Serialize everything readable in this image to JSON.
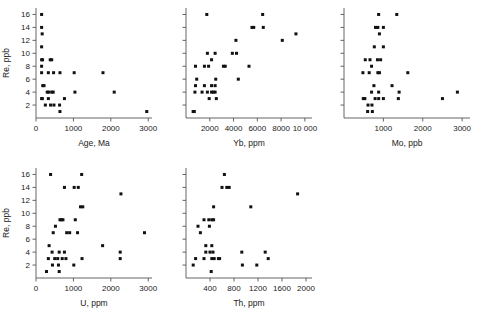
{
  "figure": {
    "background": "#ffffff",
    "marker_color": "#111111",
    "axis_color": "#555555"
  },
  "chart_data": [
    {
      "id": "panel-age",
      "type": "scatter",
      "title": "",
      "xlabel": "Age, Ma",
      "ylabel": "Re, ppb",
      "xlim": [
        0,
        3100
      ],
      "ylim": [
        0,
        17
      ],
      "xticks": [
        0,
        1000,
        2000,
        3000
      ],
      "xtick_labels": [
        "0",
        "1000",
        "2000",
        "3000"
      ],
      "yticks": [
        2,
        4,
        6,
        8,
        10,
        12,
        14,
        16
      ],
      "ytick_labels": [
        "2",
        "4",
        "6",
        "8",
        "10",
        "12",
        "14",
        "16"
      ],
      "grid": false,
      "legend": "none",
      "points": [
        [
          150,
          16
        ],
        [
          150,
          14
        ],
        [
          165,
          13
        ],
        [
          150,
          11
        ],
        [
          150,
          9
        ],
        [
          175,
          9
        ],
        [
          380,
          9
        ],
        [
          420,
          9
        ],
        [
          150,
          8
        ],
        [
          150,
          7
        ],
        [
          330,
          7
        ],
        [
          470,
          7
        ],
        [
          640,
          7
        ],
        [
          1020,
          7
        ],
        [
          1790,
          7
        ],
        [
          180,
          5
        ],
        [
          215,
          5
        ],
        [
          300,
          4
        ],
        [
          340,
          4
        ],
        [
          420,
          4
        ],
        [
          460,
          4
        ],
        [
          1040,
          4
        ],
        [
          2090,
          4
        ],
        [
          150,
          3
        ],
        [
          170,
          3
        ],
        [
          330,
          3
        ],
        [
          760,
          3
        ],
        [
          250,
          2
        ],
        [
          390,
          2
        ],
        [
          480,
          2
        ],
        [
          630,
          2
        ],
        [
          640,
          1
        ],
        [
          2960,
          1
        ]
      ]
    },
    {
      "id": "panel-yb",
      "type": "scatter",
      "title": "",
      "xlabel": "Yb, ppm",
      "ylabel": "",
      "xlim": [
        0,
        10600
      ],
      "ylim": [
        0,
        17
      ],
      "xticks": [
        2000,
        4000,
        6000,
        8000,
        10000
      ],
      "xtick_labels": [
        "2000",
        "4000",
        "6000",
        "8000",
        "10 000"
      ],
      "yticks": [
        2,
        4,
        6,
        8,
        10,
        12,
        14,
        16
      ],
      "ytick_labels": [],
      "grid": false,
      "legend": "none",
      "points": [
        [
          1750,
          16
        ],
        [
          6450,
          16
        ],
        [
          5550,
          14
        ],
        [
          5700,
          14
        ],
        [
          6500,
          14
        ],
        [
          9250,
          13
        ],
        [
          4200,
          12
        ],
        [
          8100,
          12
        ],
        [
          1800,
          10
        ],
        [
          2450,
          10
        ],
        [
          3900,
          10
        ],
        [
          4250,
          10
        ],
        [
          2150,
          9
        ],
        [
          800,
          8
        ],
        [
          1550,
          8
        ],
        [
          1900,
          8
        ],
        [
          3150,
          8
        ],
        [
          3300,
          8
        ],
        [
          5300,
          8
        ],
        [
          900,
          6
        ],
        [
          2500,
          6
        ],
        [
          4400,
          6
        ],
        [
          800,
          5
        ],
        [
          1550,
          5
        ],
        [
          2150,
          5
        ],
        [
          2450,
          5
        ],
        [
          750,
          4
        ],
        [
          1350,
          4
        ],
        [
          1800,
          4
        ],
        [
          2150,
          4
        ],
        [
          2300,
          4
        ],
        [
          2450,
          4
        ],
        [
          1950,
          3
        ],
        [
          2550,
          3
        ],
        [
          600,
          1
        ],
        [
          700,
          1
        ]
      ]
    },
    {
      "id": "panel-mo",
      "type": "scatter",
      "title": "",
      "xlabel": "Mo, ppb",
      "ylabel": "",
      "xlim": [
        0,
        3200
      ],
      "ylim": [
        0,
        17
      ],
      "xticks": [
        1000,
        2000,
        3000
      ],
      "xtick_labels": [
        "1000",
        "2000",
        "3000"
      ],
      "yticks": [
        2,
        4,
        6,
        8,
        10,
        12,
        14,
        16
      ],
      "ytick_labels": [],
      "grid": false,
      "legend": "none",
      "points": [
        [
          880,
          16
        ],
        [
          1340,
          16
        ],
        [
          800,
          14
        ],
        [
          860,
          14
        ],
        [
          1000,
          14
        ],
        [
          900,
          13
        ],
        [
          770,
          11
        ],
        [
          1000,
          11
        ],
        [
          540,
          9
        ],
        [
          660,
          9
        ],
        [
          850,
          9
        ],
        [
          930,
          9
        ],
        [
          700,
          8
        ],
        [
          480,
          7
        ],
        [
          640,
          7
        ],
        [
          860,
          7
        ],
        [
          900,
          7
        ],
        [
          1620,
          7
        ],
        [
          760,
          5
        ],
        [
          1220,
          5
        ],
        [
          700,
          4
        ],
        [
          880,
          4
        ],
        [
          1400,
          4
        ],
        [
          2880,
          4
        ],
        [
          490,
          3
        ],
        [
          530,
          3
        ],
        [
          790,
          3
        ],
        [
          880,
          3
        ],
        [
          1000,
          3
        ],
        [
          1380,
          3
        ],
        [
          2500,
          3
        ],
        [
          610,
          2
        ],
        [
          710,
          2
        ],
        [
          600,
          1
        ],
        [
          720,
          1
        ]
      ]
    },
    {
      "id": "panel-u",
      "type": "scatter",
      "title": "",
      "xlabel": "U, ppm",
      "ylabel": "Re, ppb",
      "xlim": [
        0,
        3100
      ],
      "ylim": [
        0,
        17
      ],
      "xticks": [
        0,
        1000,
        2000,
        3000
      ],
      "xtick_labels": [
        "0",
        "1000",
        "2000",
        "3000"
      ],
      "yticks": [
        2,
        4,
        6,
        8,
        10,
        12,
        14,
        16
      ],
      "ytick_labels": [
        "2",
        "4",
        "6",
        "8",
        "10",
        "12",
        "14",
        "16"
      ],
      "grid": false,
      "legend": "none",
      "points": [
        [
          390,
          16
        ],
        [
          1220,
          16
        ],
        [
          760,
          14
        ],
        [
          1020,
          14
        ],
        [
          1130,
          14
        ],
        [
          2270,
          13
        ],
        [
          1190,
          11
        ],
        [
          1250,
          11
        ],
        [
          640,
          9
        ],
        [
          680,
          9
        ],
        [
          720,
          9
        ],
        [
          1050,
          9
        ],
        [
          520,
          8
        ],
        [
          460,
          7
        ],
        [
          820,
          7
        ],
        [
          900,
          7
        ],
        [
          1110,
          7
        ],
        [
          2900,
          7
        ],
        [
          350,
          5
        ],
        [
          1780,
          5
        ],
        [
          430,
          4
        ],
        [
          620,
          4
        ],
        [
          760,
          4
        ],
        [
          2250,
          4
        ],
        [
          330,
          3
        ],
        [
          500,
          3
        ],
        [
          580,
          3
        ],
        [
          700,
          3
        ],
        [
          800,
          3
        ],
        [
          1230,
          3
        ],
        [
          2250,
          3
        ],
        [
          440,
          2
        ],
        [
          600,
          2
        ],
        [
          1010,
          2
        ],
        [
          280,
          1
        ],
        [
          620,
          1
        ]
      ]
    },
    {
      "id": "panel-th",
      "type": "scatter",
      "title": "",
      "xlabel": "Th, ppm",
      "ylabel": "",
      "xlim": [
        0,
        2100
      ],
      "ylim": [
        0,
        17
      ],
      "xticks": [
        400,
        800,
        1200,
        1600,
        2000
      ],
      "xtick_labels": [
        "400",
        "800",
        "1200",
        "1600",
        "2000"
      ],
      "yticks": [
        2,
        4,
        6,
        8,
        10,
        12,
        14,
        16
      ],
      "ytick_labels": [],
      "grid": false,
      "legend": "none",
      "points": [
        [
          640,
          16
        ],
        [
          600,
          14
        ],
        [
          680,
          14
        ],
        [
          720,
          14
        ],
        [
          1860,
          13
        ],
        [
          460,
          11
        ],
        [
          1080,
          11
        ],
        [
          300,
          9
        ],
        [
          380,
          9
        ],
        [
          430,
          9
        ],
        [
          460,
          9
        ],
        [
          200,
          8
        ],
        [
          390,
          8
        ],
        [
          240,
          7
        ],
        [
          330,
          5
        ],
        [
          430,
          5
        ],
        [
          330,
          4
        ],
        [
          400,
          4
        ],
        [
          450,
          4
        ],
        [
          930,
          4
        ],
        [
          1320,
          4
        ],
        [
          160,
          3
        ],
        [
          300,
          3
        ],
        [
          430,
          3
        ],
        [
          470,
          3
        ],
        [
          540,
          3
        ],
        [
          560,
          3
        ],
        [
          1370,
          3
        ],
        [
          940,
          2
        ],
        [
          1180,
          2
        ],
        [
          120,
          2
        ],
        [
          420,
          1
        ]
      ]
    }
  ]
}
